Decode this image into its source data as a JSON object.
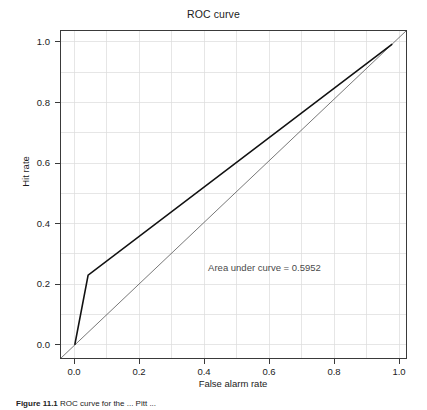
{
  "figure": {
    "title": "ROC curve",
    "caption_label": "Figure 11.1",
    "caption_text": "ROC curve for the ... Pitt ...",
    "background_color": "#ffffff"
  },
  "chart_data": {
    "type": "line",
    "title": "ROC curve",
    "xlabel": "False alarm rate",
    "ylabel": "Hit rate",
    "xlim": [
      -0.045,
      1.045
    ],
    "ylim": [
      -0.045,
      1.045
    ],
    "xticks": [
      0.0,
      0.2,
      0.4,
      0.6,
      0.8,
      1.0
    ],
    "yticks": [
      0.0,
      0.2,
      0.4,
      0.6,
      0.8,
      1.0
    ],
    "xtick_labels": [
      "0.0",
      "0.2",
      "0.4",
      "0.6",
      "0.8",
      "1.0"
    ],
    "ytick_labels": [
      "0.0",
      "0.2",
      "0.4",
      "0.6",
      "0.8",
      "1.0"
    ],
    "grid": true,
    "grid_color": "#d8d8d8",
    "grid_minor_step": 0.1,
    "legend": null,
    "series": [
      {
        "name": "ROC curve",
        "color": "#111111",
        "line_width": 1.6,
        "x": [
          0.0,
          0.042,
          1.0
        ],
        "y": [
          0.0,
          0.232,
          1.0
        ]
      },
      {
        "name": "chance diagonal",
        "color": "#555555",
        "line_width": 0.8,
        "x": [
          -0.045,
          1.045
        ],
        "y": [
          -0.045,
          1.045
        ]
      }
    ],
    "annotations": [
      {
        "text": "Area under curve = 0.5952",
        "x": 0.42,
        "y": 0.255,
        "color": "#4a4a4a"
      }
    ],
    "area_under_curve": 0.5952
  }
}
